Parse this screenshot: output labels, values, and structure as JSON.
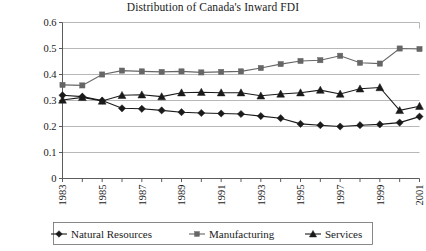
{
  "chart_data": {
    "type": "line",
    "title": "Distribution of Canada's Inward FDI",
    "xlabel": "",
    "ylabel": "",
    "grid": true,
    "legend_position": "bottom",
    "xlim": [
      1983,
      2001
    ],
    "ylim": [
      0,
      0.6
    ],
    "ytick_values": [
      0,
      0.1,
      0.2,
      0.3,
      0.4,
      0.5,
      0.6
    ],
    "ytick_labels": [
      "0",
      "0.1",
      "0.2",
      "0.3",
      "0.4",
      "0.5",
      "0.6"
    ],
    "x": [
      1983,
      1984,
      1985,
      1986,
      1987,
      1988,
      1989,
      1990,
      1991,
      1992,
      1993,
      1994,
      1995,
      1996,
      1997,
      1998,
      1999,
      2000,
      2001
    ],
    "xtick_labels": [
      "1983",
      "",
      "1985",
      "",
      "1987",
      "",
      "1989",
      "",
      "1991",
      "",
      "1993",
      "",
      "1995",
      "",
      "1997",
      "",
      "1999",
      "",
      "2001"
    ],
    "xtick_labels_shown": [
      "1983",
      "1985",
      "1987",
      "1989",
      "1991",
      "1993",
      "1995",
      "1997",
      "1999",
      "2001"
    ],
    "xtick_rotation": 90,
    "series": [
      {
        "name": "Natural Resources",
        "marker": "diamond",
        "color": "#1a1a1a",
        "values": [
          0.32,
          0.315,
          0.3,
          0.27,
          0.268,
          0.262,
          0.255,
          0.252,
          0.25,
          0.248,
          0.24,
          0.232,
          0.21,
          0.205,
          0.2,
          0.205,
          0.208,
          0.215,
          0.238
        ]
      },
      {
        "name": "Manufacturing",
        "marker": "square",
        "color": "#666666",
        "values": [
          0.36,
          0.358,
          0.4,
          0.415,
          0.412,
          0.41,
          0.412,
          0.408,
          0.41,
          0.412,
          0.425,
          0.44,
          0.452,
          0.455,
          0.472,
          0.445,
          0.442,
          0.5,
          0.498
        ]
      },
      {
        "name": "Services",
        "marker": "triangle",
        "color": "#1a1a1a",
        "values": [
          0.302,
          0.312,
          0.298,
          0.32,
          0.322,
          0.315,
          0.33,
          0.332,
          0.33,
          0.33,
          0.318,
          0.325,
          0.33,
          0.34,
          0.325,
          0.345,
          0.35,
          0.262,
          0.278
        ]
      }
    ]
  },
  "legend": {
    "entries": [
      {
        "label": "Natural Resources",
        "marker": "diamond"
      },
      {
        "label": "Manufacturing",
        "marker": "square"
      },
      {
        "label": "Services",
        "marker": "triangle"
      }
    ]
  }
}
